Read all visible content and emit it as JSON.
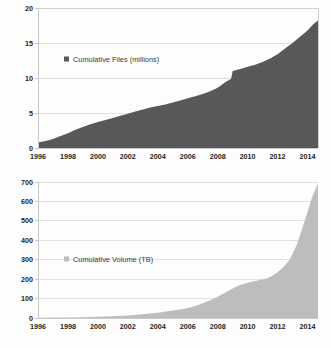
{
  "figure": {
    "background_color": "#fdfdfd",
    "panel_count": 2
  },
  "chart_data": [
    {
      "id": "cumulative-files",
      "type": "area",
      "title": "",
      "xlabel": "",
      "ylabel": "",
      "legend": [
        "Cumulative Files (millions)"
      ],
      "legend_position": "inside-upper-left",
      "series_color": "#58585a",
      "grid": true,
      "xlim": [
        1996,
        2014.7
      ],
      "ylim": [
        0,
        20
      ],
      "yticks": [
        0,
        5,
        10,
        15,
        20
      ],
      "ytick_labels": [
        "0",
        "5",
        "10",
        "15",
        "20"
      ],
      "xticks": [
        1996,
        1998,
        2000,
        2002,
        2004,
        2006,
        2008,
        2010,
        2012,
        2014
      ],
      "xtick_labels": [
        "1996",
        "1998",
        "2000",
        "2002",
        "2004",
        "2006",
        "2008",
        "2010",
        "2012",
        "2014"
      ],
      "series": [
        {
          "name": "Cumulative Files (millions)",
          "x": [
            1996,
            1996.5,
            1997,
            1997.5,
            1998,
            1998.5,
            1999,
            1999.5,
            2000,
            2000.5,
            2001,
            2001.5,
            2002,
            2002.5,
            2003,
            2003.5,
            2004,
            2004.5,
            2005,
            2005.5,
            2006,
            2006.5,
            2007,
            2007.5,
            2008,
            2008.5,
            2008.9,
            2009.0,
            2009.5,
            2010,
            2010.5,
            2011,
            2011.5,
            2012,
            2012.5,
            2013,
            2013.5,
            2014,
            2014.4,
            2014.7
          ],
          "values": [
            0.8,
            1.0,
            1.3,
            1.7,
            2.1,
            2.6,
            3.0,
            3.4,
            3.7,
            4.0,
            4.3,
            4.6,
            4.9,
            5.2,
            5.5,
            5.8,
            6.0,
            6.2,
            6.5,
            6.8,
            7.1,
            7.4,
            7.7,
            8.1,
            8.6,
            9.4,
            9.9,
            11.0,
            11.3,
            11.6,
            11.9,
            12.3,
            12.8,
            13.4,
            14.2,
            15.0,
            15.9,
            16.8,
            17.7,
            18.2
          ]
        }
      ],
      "notes": "Near-linear growth 1996-2008 from ~0.8M to ~9M files, a sharp step to ~11M in 2009, then accelerating growth to ~18.2M by mid-2014."
    },
    {
      "id": "cumulative-volume",
      "type": "area",
      "title": "",
      "xlabel": "",
      "ylabel": "",
      "legend": [
        "Cumulative Volume (TB)"
      ],
      "legend_position": "inside-upper-left",
      "series_color": "#bdbdbd",
      "grid": true,
      "xlim": [
        1996,
        2014.7
      ],
      "ylim": [
        0,
        700
      ],
      "yticks": [
        0,
        100,
        200,
        300,
        400,
        500,
        600,
        700
      ],
      "ytick_labels": [
        "0",
        "100",
        "200",
        "300",
        "400",
        "500",
        "600",
        "700"
      ],
      "xticks": [
        1996,
        1998,
        2000,
        2002,
        2004,
        2006,
        2008,
        2010,
        2012,
        2014
      ],
      "xtick_labels": [
        "1996",
        "1998",
        "2000",
        "2002",
        "2004",
        "2006",
        "2008",
        "2010",
        "2012",
        "2014"
      ],
      "series": [
        {
          "name": "Cumulative Volume (TB)",
          "x": [
            1996,
            1997,
            1998,
            1999,
            2000,
            2001,
            2002,
            2003,
            2004,
            2005,
            2005.5,
            2006,
            2006.5,
            2007,
            2007.5,
            2008,
            2008.5,
            2009,
            2009.5,
            2010,
            2010.5,
            2011,
            2011.3,
            2011.6,
            2012,
            2012.4,
            2012.8,
            2013,
            2013.3,
            2013.6,
            2014,
            2014.3,
            2014.6,
            2014.7
          ],
          "values": [
            1,
            2,
            3,
            4,
            6,
            9,
            13,
            19,
            27,
            38,
            44,
            52,
            62,
            76,
            92,
            110,
            130,
            152,
            170,
            182,
            190,
            198,
            205,
            215,
            235,
            262,
            300,
            330,
            380,
            450,
            545,
            620,
            675,
            690
          ]
        }
      ],
      "notes": "Flat near zero until ~2004, slow rise to ~190 TB by 2010, plateau near 200 TB to 2012, then steep exponential rise to ~690 TB by mid-2014."
    }
  ]
}
